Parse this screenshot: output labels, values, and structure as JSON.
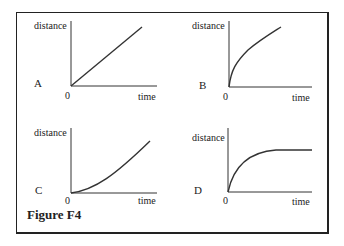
{
  "caption": "Figure F4",
  "panels": [
    {
      "letter": "A",
      "ylabel": "distance",
      "xlabel": "time",
      "origin": "0",
      "shape": "straight line (constant speed)"
    },
    {
      "letter": "B",
      "ylabel": "distance",
      "xlabel": "time",
      "origin": "0",
      "shape": "concave-down curve (decreasing speed)"
    },
    {
      "letter": "C",
      "ylabel": "distance",
      "xlabel": "time",
      "origin": "0",
      "shape": "concave-up curve (increasing speed)"
    },
    {
      "letter": "D",
      "ylabel": "distance",
      "xlabel": "time",
      "origin": "0",
      "shape": "rises then levels off (stops)"
    }
  ]
}
